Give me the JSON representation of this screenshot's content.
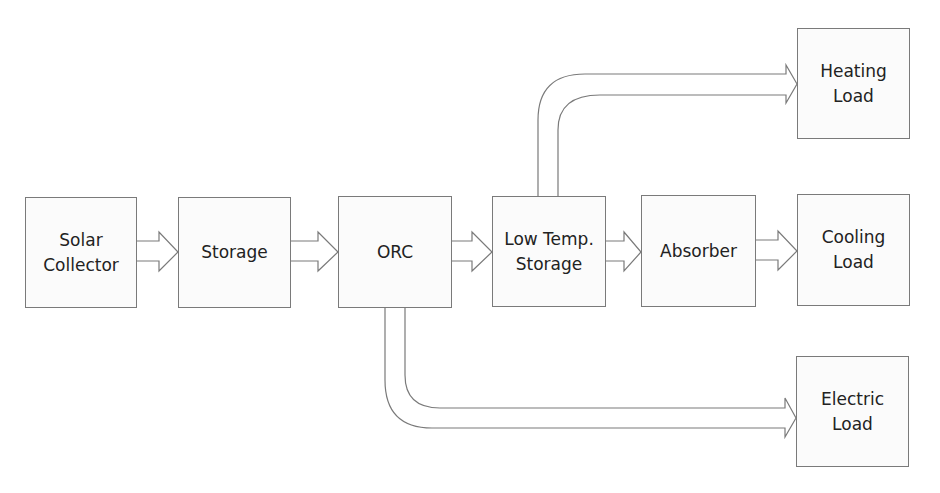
{
  "diagram": {
    "blocks": {
      "solar_collector": {
        "label": "Solar\nCollector"
      },
      "storage": {
        "label": "Storage"
      },
      "orc": {
        "label": "ORC"
      },
      "low_temp_storage": {
        "label": "Low Temp.\nStorage"
      },
      "absorber": {
        "label": "Absorber"
      },
      "heating_load": {
        "label": "Heating\nLoad"
      },
      "cooling_load": {
        "label": "Cooling\nLoad"
      },
      "electric_load": {
        "label": "Electric\nLoad"
      }
    },
    "flows": [
      {
        "from": "Solar Collector",
        "to": "Storage"
      },
      {
        "from": "Storage",
        "to": "ORC"
      },
      {
        "from": "ORC",
        "to": "Low Temp. Storage"
      },
      {
        "from": "Low Temp. Storage",
        "to": "Absorber"
      },
      {
        "from": "Absorber",
        "to": "Cooling Load"
      },
      {
        "from": "Low Temp. Storage",
        "to": "Heating Load"
      },
      {
        "from": "ORC",
        "to": "Electric Load"
      }
    ],
    "colors": {
      "stroke": "#7a7a7a",
      "fill": "#fbfbfb",
      "text": "#222222"
    }
  }
}
